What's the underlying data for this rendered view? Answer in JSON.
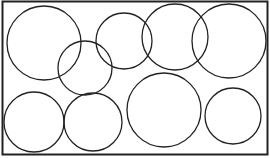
{
  "diagram": {
    "width": 270,
    "height": 158,
    "background": "#ffffff",
    "stroke_color": "#222222",
    "frame": {
      "x": 2.5,
      "y": 1.5,
      "width": 265,
      "height": 153,
      "stroke_width": 2
    },
    "circles": [
      {
        "id": "circle-top-left",
        "cx": 44,
        "cy": 43,
        "r": 37
      },
      {
        "id": "circle-middle-overlap",
        "cx": 85,
        "cy": 68,
        "r": 27
      },
      {
        "id": "circle-top-center",
        "cx": 124,
        "cy": 41,
        "r": 28
      },
      {
        "id": "circle-top-center-right",
        "cx": 175,
        "cy": 37,
        "r": 33
      },
      {
        "id": "circle-top-right",
        "cx": 229,
        "cy": 41,
        "r": 37
      },
      {
        "id": "circle-bottom-left",
        "cx": 34,
        "cy": 122,
        "r": 30
      },
      {
        "id": "circle-bottom-center-left",
        "cx": 93,
        "cy": 122,
        "r": 29
      },
      {
        "id": "circle-bottom-center",
        "cx": 164,
        "cy": 110,
        "r": 37
      },
      {
        "id": "circle-bottom-right",
        "cx": 233,
        "cy": 116,
        "r": 28
      }
    ]
  }
}
